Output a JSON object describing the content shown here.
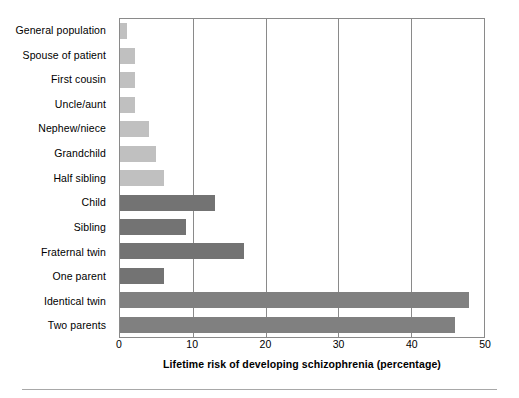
{
  "chart_data": {
    "type": "bar",
    "orientation": "horizontal",
    "title": "",
    "xlabel": "Lifetime risk of developing schizophrenia (percentage)",
    "ylabel": "",
    "xlim": [
      0,
      50
    ],
    "xticks": [
      0,
      10,
      20,
      30,
      40,
      50
    ],
    "grid": "vertical",
    "legend": "none",
    "categories": [
      "General population",
      "Spouse of patient",
      "First cousin",
      "Uncle/aunt",
      "Nephew/niece",
      "Grandchild",
      "Half sibling",
      "Child",
      "Sibling",
      "Fraternal twin",
      "One parent",
      "Identical twin",
      "Two parents"
    ],
    "values": [
      1,
      2,
      2,
      2,
      4,
      5,
      6,
      13,
      9,
      17,
      6,
      48,
      46
    ],
    "bar_colors": [
      "#c0c0c0",
      "#c0c0c0",
      "#c0c0c0",
      "#c0c0c0",
      "#c0c0c0",
      "#c0c0c0",
      "#c0c0c0",
      "#737373",
      "#737373",
      "#737373",
      "#737373",
      "#808080",
      "#808080"
    ]
  },
  "axis": {
    "tick_labels": [
      "0",
      "10",
      "20",
      "30",
      "40",
      "50"
    ]
  },
  "colors": {
    "light_bar": "#c0c0c0",
    "dark_bar": "#737373",
    "mid_bar": "#808080",
    "frame": "#8a8a8a",
    "text": "#000000",
    "rule": "#a8a8a8"
  }
}
